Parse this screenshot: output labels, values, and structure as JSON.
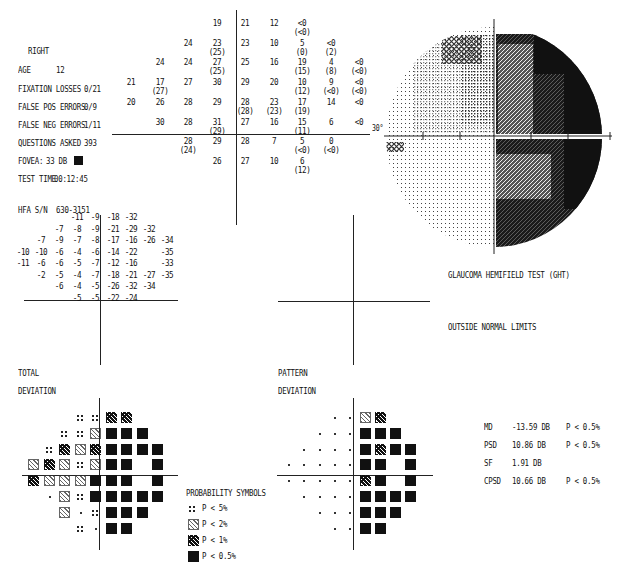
{
  "header": {
    "eye": "RIGHT",
    "age_label": "AGE",
    "age": "12",
    "fixation_losses_label": "FIXATION LOSSES",
    "fixation_losses": "0/21",
    "false_pos_label": "FALSE POS ERRORS",
    "false_pos": "0/9",
    "false_neg_label": "FALSE NEG ERRORS",
    "false_neg": "1/11",
    "questions_label": "QUESTIONS ASKED",
    "questions": "393",
    "fovea_label": "FOVEA:",
    "fovea": "33 DB",
    "test_time_label": "TEST TIME",
    "test_time": "00:12:45",
    "serial_label": "HFA S/N",
    "serial": "630-3151"
  },
  "greyscale": {
    "axis_label": "30°"
  },
  "ght": {
    "title": "GLAUCOMA HEMIFIELD TEST (GHT)",
    "result": "OUTSIDE NORMAL LIMITS"
  },
  "labels": {
    "total_1": "TOTAL",
    "total_2": "DEVIATION",
    "pattern_1": "PATTERN",
    "pattern_2": "DEVIATION"
  },
  "indices": [
    {
      "name": "MD",
      "value": "-13.59 DB",
      "p": "P < 0.5%"
    },
    {
      "name": "PSD",
      "value": "10.86 DB",
      "p": "P < 0.5%"
    },
    {
      "name": "SF",
      "value": "1.91 DB",
      "p": ""
    },
    {
      "name": "CPSD",
      "value": "10.66 DB",
      "p": "P < 0.5%"
    }
  ],
  "legend": {
    "title": "PROBABILITY SYMBOLS",
    "items": [
      {
        "symbol": "dot5",
        "label": "P <  5%"
      },
      {
        "symbol": "hatch2",
        "label": "P <  2%"
      },
      {
        "symbol": "hatch1",
        "label": "P <  1%"
      },
      {
        "symbol": "blk",
        "label": "P < 0.5%"
      }
    ]
  },
  "chart_data": [
    {
      "type": "table",
      "title": "Threshold values (dB), parentheses = repeat test",
      "rows": [
        [
          "",
          "",
          "",
          "19",
          "21",
          "12",
          "<0 (<0)",
          "",
          ""
        ],
        [
          "",
          "",
          "24",
          "23 (25)",
          "23",
          "10",
          "5 (0)",
          "<0 (2)",
          ""
        ],
        [
          "",
          "24",
          "24",
          "27 (25)",
          "25",
          "16",
          "19 (15)",
          "4 (8)",
          "<0 (<0)"
        ],
        [
          "21",
          "17 (27)",
          "27",
          "30",
          "29",
          "20",
          "10 (12)",
          "9 (<0)",
          "<0 (<0)"
        ],
        [
          "20",
          "26",
          "28",
          "29",
          "28 (28)",
          "23 (23)",
          "17 (19)",
          "14",
          "<0"
        ],
        [
          "",
          "30",
          "28",
          "31 (29)",
          "27",
          "16",
          "15 (11)",
          "6",
          "<0"
        ],
        [
          "",
          "",
          "28 (24)",
          "29",
          "28",
          "7",
          "5 (<0)",
          "0 (<0)",
          ""
        ],
        [
          "",
          "",
          "",
          "26",
          "27",
          "10",
          "6 (12)",
          "",
          ""
        ]
      ]
    },
    {
      "type": "table",
      "title": "TOTAL DEVIATION",
      "rows": [
        [
          "",
          "",
          "",
          "-11",
          "-9",
          "-18",
          "-32",
          "",
          ""
        ],
        [
          "",
          "",
          "-7",
          "-8",
          "-9",
          "-21",
          "-29",
          "-32",
          ""
        ],
        [
          "",
          "-7",
          "-9",
          "-7",
          "-8",
          "-17",
          "-16",
          "-26",
          "-34"
        ],
        [
          "-10",
          "-10",
          "-6",
          "-4",
          "-6",
          "-14",
          "-22",
          "",
          "-35"
        ],
        [
          "-11",
          "-6",
          "-6",
          "-5",
          "-7",
          "-12",
          "-16",
          "",
          "-33"
        ],
        [
          "",
          "-2",
          "-5",
          "-4",
          "-7",
          "-18",
          "-21",
          "-27",
          "-35"
        ],
        [
          "",
          "",
          "-6",
          "-4",
          "-5",
          "-26",
          "-32",
          "-34",
          ""
        ],
        [
          "",
          "",
          "",
          "-5",
          "-5",
          "-22",
          "-24",
          "",
          ""
        ]
      ]
    },
    {
      "type": "table",
      "title": "PATTERN DEVIATION",
      "rows": [
        [
          "",
          "",
          "",
          "-6",
          "-4",
          "-13",
          "-27",
          "",
          ""
        ],
        [
          "",
          "",
          "-2",
          "-3",
          "-4",
          "-17",
          "-25",
          "-27",
          ""
        ],
        [
          "",
          "-2",
          "-4",
          "-3",
          "-4",
          "-12",
          "-11",
          "-21",
          "-29"
        ],
        [
          "-5",
          "-5",
          "-2",
          "1",
          "-1",
          "-9",
          "-17",
          "",
          "-30"
        ],
        [
          "-6",
          "-2",
          "-1",
          "-1",
          "-2",
          "-7",
          "-11",
          "",
          "-28"
        ],
        [
          "",
          "3",
          "0",
          "1",
          "-2",
          "-13",
          "-16",
          "-22",
          "-30"
        ],
        [
          "",
          "",
          "-1",
          "1",
          "0",
          "-21",
          "-27",
          "-29",
          ""
        ],
        [
          "",
          "",
          "",
          "-1",
          "0",
          "-17",
          "-19",
          "",
          ""
        ]
      ]
    },
    {
      "type": "heatmap",
      "title": "TOTAL DEVIATION probability map",
      "legend": [
        "dot5 = P<5%",
        "hatch2 = P<2%",
        "hatch1 = P<1%",
        "blk = P<0.5%",
        "pt = normal"
      ],
      "rows": [
        [
          "",
          "",
          "",
          "dot5",
          "dot5",
          "hatch1",
          "hatch1",
          "",
          ""
        ],
        [
          "",
          "",
          "dot5",
          "dot5",
          "hatch2",
          "blk",
          "blk",
          "blk",
          ""
        ],
        [
          "",
          "dot5",
          "hatch1",
          "hatch2",
          "hatch1",
          "blk",
          "blk",
          "blk",
          "blk"
        ],
        [
          "hatch2",
          "hatch1",
          "hatch2",
          "dot5",
          "hatch2",
          "blk",
          "blk",
          "",
          "blk"
        ],
        [
          "hatch1",
          "hatch2",
          "hatch2",
          "hatch2",
          "blk",
          "blk",
          "blk",
          "",
          "blk"
        ],
        [
          "",
          "pt",
          "hatch2",
          "dot5",
          "blk",
          "blk",
          "blk",
          "blk",
          "blk"
        ],
        [
          "",
          "",
          "hatch2",
          "pt",
          "dot5",
          "blk",
          "blk",
          "blk",
          ""
        ],
        [
          "",
          "",
          "",
          "dot5",
          "pt",
          "blk",
          "blk",
          "",
          ""
        ]
      ]
    },
    {
      "type": "heatmap",
      "title": "PATTERN DEVIATION probability map",
      "rows": [
        [
          "",
          "",
          "",
          "pt",
          "pt",
          "hatch2",
          "hatch1",
          "",
          ""
        ],
        [
          "",
          "",
          "pt",
          "pt",
          "pt",
          "blk",
          "blk",
          "blk",
          ""
        ],
        [
          "",
          "pt",
          "pt",
          "pt",
          "pt",
          "blk",
          "hatch1",
          "blk",
          "blk"
        ],
        [
          "pt",
          "pt",
          "pt",
          "pt",
          "pt",
          "blk",
          "blk",
          "",
          "blk"
        ],
        [
          "pt",
          "pt",
          "pt",
          "pt",
          "pt",
          "hatch1",
          "blk",
          "",
          "blk"
        ],
        [
          "",
          "pt",
          "pt",
          "pt",
          "pt",
          "blk",
          "blk",
          "blk",
          "blk"
        ],
        [
          "",
          "",
          "pt",
          "pt",
          "pt",
          "blk",
          "blk",
          "blk",
          ""
        ],
        [
          "",
          "",
          "",
          "pt",
          "pt",
          "blk",
          "blk",
          "",
          ""
        ]
      ]
    }
  ]
}
